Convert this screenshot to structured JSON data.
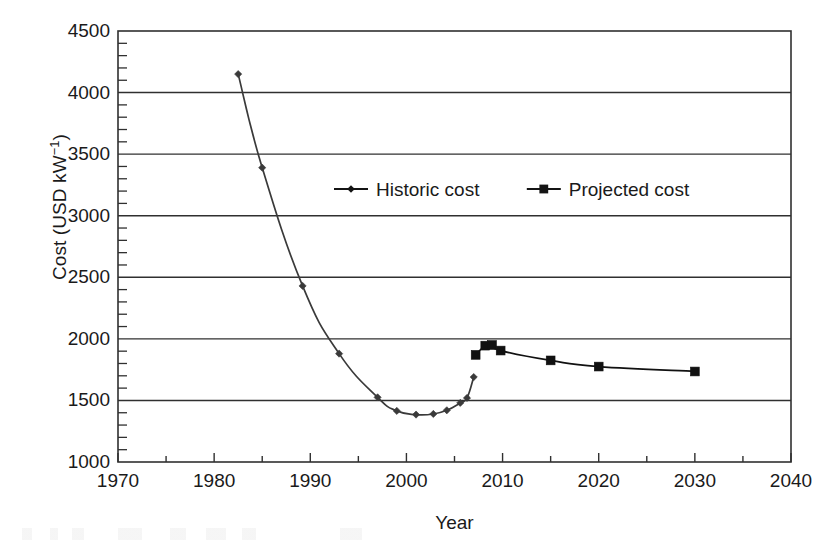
{
  "chart_data": {
    "type": "line",
    "title": "",
    "xlabel": "Year",
    "ylabel": "Cost (USD kW",
    "ylabel_sup": "−1",
    "ylabel_tail": ")",
    "xlim": [
      1970,
      2040
    ],
    "ylim": [
      1000,
      4500
    ],
    "grid": true,
    "grid_axis": "y",
    "legend_position": "upper-center",
    "x_ticks": [
      1970,
      1980,
      1990,
      2000,
      2010,
      2020,
      2030,
      2040
    ],
    "x_tick_labels": [
      "1970",
      "1980",
      "1990",
      "2000",
      "2010",
      "2020",
      "2030",
      "2040"
    ],
    "x_minor_step": 5,
    "y_ticks": [
      1000,
      1500,
      2000,
      2500,
      3000,
      3500,
      4000,
      4500
    ],
    "y_tick_labels": [
      "1000",
      "1500",
      "2000",
      "2500",
      "3000",
      "3500",
      "4000",
      "4500"
    ],
    "y_minor_step": 100,
    "series": [
      {
        "name": "Historic cost",
        "marker": "diamond",
        "color": "#3a3a3a",
        "points": [
          [
            1982.5,
            4150
          ],
          [
            1985.0,
            3390
          ],
          [
            1989.2,
            2430
          ],
          [
            1993.0,
            1880
          ],
          [
            1997.0,
            1525
          ],
          [
            1999.0,
            1415
          ],
          [
            2001.0,
            1385
          ],
          [
            2002.8,
            1390
          ],
          [
            2004.2,
            1420
          ],
          [
            2005.6,
            1480
          ],
          [
            2006.3,
            1520
          ],
          [
            2007.0,
            1690
          ]
        ]
      },
      {
        "name": "Projected cost",
        "marker": "square",
        "color": "#111111",
        "points": [
          [
            2007.2,
            1870
          ],
          [
            2008.2,
            1945
          ],
          [
            2008.9,
            1950
          ],
          [
            2009.8,
            1905
          ],
          [
            2015.0,
            1825
          ],
          [
            2020.0,
            1775
          ],
          [
            2030.0,
            1735
          ]
        ]
      }
    ]
  },
  "legend": {
    "entries": [
      {
        "label": "Historic cost",
        "marker": "diamond"
      },
      {
        "label": "Projected cost",
        "marker": "square"
      }
    ]
  }
}
